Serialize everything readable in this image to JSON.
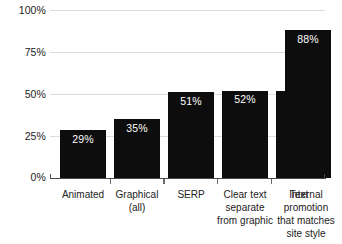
{
  "chart_data": {
    "type": "bar",
    "title": "",
    "subtitle": "",
    "xlabel": "",
    "ylabel": "",
    "ylim": [
      0,
      100
    ],
    "grid": true,
    "legend": false,
    "bar_color": "#0d0d0d",
    "gridline_color": "#dcdcdc",
    "axis_color": "#4a4a4a",
    "value_label_color": "#ffffff",
    "categories": [
      "Animated",
      "Graphical (all)",
      "SERP",
      "Clear text separate from graphic",
      "Text",
      "Internal promotion that matches site style"
    ],
    "values": [
      29,
      35,
      51,
      52,
      52,
      88
    ],
    "value_labels": [
      "29%",
      "35%",
      "51%",
      "52%",
      "52%",
      "88%"
    ],
    "ytick_values": [
      0,
      25,
      50,
      75,
      100
    ],
    "ytick_labels": [
      "0%",
      "25%",
      "50%",
      "75%",
      "100%"
    ]
  },
  "axis": {
    "y": {
      "labels": [
        "100%",
        "75%",
        "50%",
        "25%",
        "0%"
      ]
    }
  },
  "categories_display": [
    {
      "lines": [
        "Animated"
      ]
    },
    {
      "lines": [
        "Graphical",
        "(all)"
      ]
    },
    {
      "lines": [
        "SERP"
      ]
    },
    {
      "lines": [
        "Clear text",
        "separate",
        "from graphic"
      ]
    },
    {
      "lines": [
        "Text"
      ]
    },
    {
      "lines": [
        "Internal",
        "promotion",
        "that matches",
        "site style"
      ]
    }
  ]
}
